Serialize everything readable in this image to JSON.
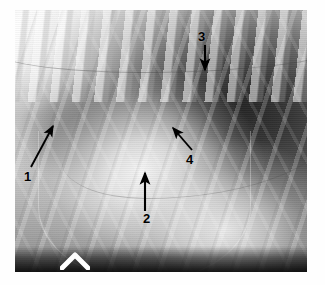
{
  "figure": {
    "kind": "radiograph",
    "modality": "x-ray",
    "view": "lateral thorax",
    "background_color": "#ffffff",
    "plate": {
      "border_color": "#ffffff",
      "darkest_gray": "#1e1e1e",
      "lightest_gray": "#ffffff",
      "mid_gray": "#8a8a8a"
    },
    "marker": {
      "name": "positioning-marker",
      "shape": "chevron",
      "color": "#ffffff"
    },
    "annotations": [
      {
        "id": "1",
        "label": "1",
        "arrow": "up-right",
        "color": "#000000"
      },
      {
        "id": "2",
        "label": "2",
        "arrow": "up",
        "color": "#000000"
      },
      {
        "id": "3",
        "label": "3",
        "arrow": "down",
        "color": "#000000"
      },
      {
        "id": "4",
        "label": "4",
        "arrow": "up-left",
        "color": "#000000"
      }
    ]
  }
}
